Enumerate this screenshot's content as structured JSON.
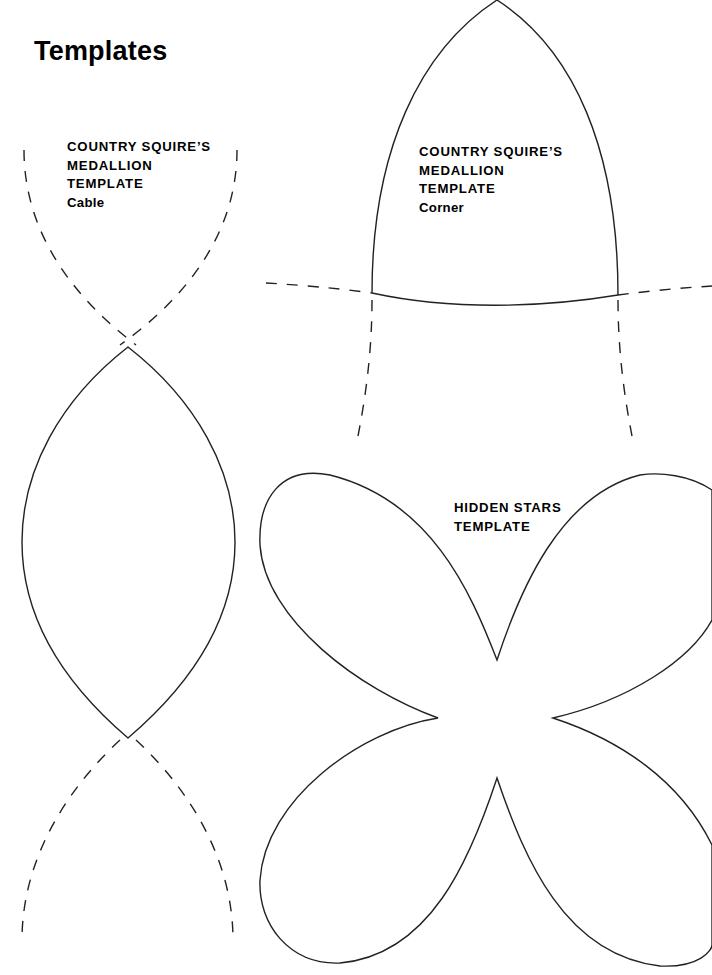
{
  "page": {
    "title": "Templates"
  },
  "templates": [
    {
      "id": "cable",
      "lines": [
        "COUNTRY SQUIRE’S",
        "MEDALLION",
        "TEMPLATE"
      ],
      "subtitle": "Cable"
    },
    {
      "id": "corner",
      "lines": [
        "COUNTRY SQUIRE’S",
        "MEDALLION",
        "TEMPLATE"
      ],
      "subtitle": "Corner"
    },
    {
      "id": "hidden-stars",
      "lines": [
        "HIDDEN STARS",
        "TEMPLATE"
      ],
      "subtitle": ""
    }
  ],
  "colors": {
    "background": "#ffffff",
    "ink": "#222222"
  }
}
